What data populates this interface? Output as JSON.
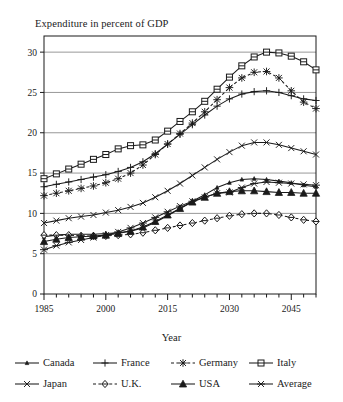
{
  "chart_data": {
    "type": "line",
    "title": "Expenditure in percent of GDP",
    "xlabel": "Year",
    "ylabel": "",
    "xlim": [
      1985,
      2051
    ],
    "ylim": [
      0,
      32
    ],
    "grid": "horizontal",
    "x_ticks": [
      1985,
      2000,
      2015,
      2030,
      2045
    ],
    "x_minor_step": 3,
    "y_ticks": [
      0,
      5,
      10,
      15,
      20,
      25,
      30
    ],
    "legend_position": "bottom",
    "marker_step_years": 3,
    "x": [
      1985,
      1988,
      1991,
      1994,
      1997,
      2000,
      2003,
      2006,
      2009,
      2012,
      2015,
      2018,
      2021,
      2024,
      2027,
      2030,
      2033,
      2036,
      2039,
      2042,
      2045,
      2048,
      2051
    ],
    "series": [
      {
        "name": "Canada",
        "marker": "small-triangle",
        "dash": "solid",
        "values": [
          7.1,
          7.3,
          7.4,
          7.4,
          7.4,
          7.5,
          7.6,
          7.8,
          8.2,
          8.9,
          9.7,
          10.6,
          11.5,
          12.3,
          13.2,
          13.8,
          14.2,
          14.3,
          14.2,
          14.0,
          13.8,
          13.5,
          13.3
        ]
      },
      {
        "name": "France",
        "marker": "plus",
        "dash": "solid",
        "values": [
          13.3,
          13.6,
          13.9,
          14.2,
          14.5,
          14.8,
          15.2,
          15.7,
          16.4,
          17.4,
          18.6,
          19.8,
          21.0,
          22.2,
          23.3,
          24.2,
          24.8,
          25.1,
          25.2,
          25.0,
          24.6,
          24.2,
          24.0
        ]
      },
      {
        "name": "Germany",
        "marker": "asterisk",
        "dash": "dashed",
        "values": [
          12.2,
          12.5,
          12.8,
          13.1,
          13.4,
          13.8,
          14.3,
          15.0,
          16.0,
          17.3,
          18.6,
          19.9,
          21.2,
          22.6,
          24.1,
          25.6,
          26.8,
          27.5,
          27.6,
          26.8,
          25.2,
          23.8,
          23.0
        ]
      },
      {
        "name": "Italy",
        "marker": "open-square",
        "dash": "solid",
        "values": [
          14.3,
          14.9,
          15.5,
          16.1,
          16.7,
          17.3,
          18.0,
          18.4,
          18.5,
          19.1,
          20.2,
          21.4,
          22.6,
          23.9,
          25.4,
          26.9,
          28.3,
          29.4,
          30.0,
          29.9,
          29.5,
          28.8,
          27.8
        ]
      },
      {
        "name": "Japan",
        "marker": "x-cross",
        "dash": "solid",
        "values": [
          8.8,
          9.1,
          9.4,
          9.6,
          9.8,
          10.1,
          10.4,
          10.8,
          11.3,
          12.0,
          12.8,
          13.7,
          14.7,
          15.7,
          16.7,
          17.6,
          18.4,
          18.8,
          18.8,
          18.5,
          18.1,
          17.7,
          17.3
        ]
      },
      {
        "name": "U.K.",
        "marker": "open-diamond",
        "dash": "dashed",
        "values": [
          7.3,
          7.3,
          7.3,
          7.2,
          7.2,
          7.2,
          7.3,
          7.4,
          7.6,
          7.9,
          8.2,
          8.5,
          8.8,
          9.1,
          9.4,
          9.7,
          9.9,
          10.0,
          10.0,
          9.8,
          9.5,
          9.2,
          9.0
        ]
      },
      {
        "name": "USA",
        "marker": "filled-triangle",
        "dash": "solid",
        "values": [
          6.5,
          6.8,
          7.0,
          7.1,
          7.2,
          7.3,
          7.5,
          7.8,
          8.3,
          9.0,
          9.8,
          10.6,
          11.4,
          12.0,
          12.5,
          12.7,
          12.8,
          12.8,
          12.7,
          12.6,
          12.6,
          12.5,
          12.5
        ]
      },
      {
        "name": "Average",
        "marker": "star-x",
        "dash": "solid",
        "values": [
          5.5,
          6.0,
          6.4,
          6.7,
          7.0,
          7.3,
          7.7,
          8.2,
          8.8,
          9.5,
          10.2,
          10.9,
          11.5,
          12.0,
          12.5,
          12.6,
          13.2,
          13.7,
          13.9,
          13.8,
          13.7,
          13.6,
          13.5
        ]
      }
    ]
  },
  "legend": {
    "items": [
      {
        "label": "Canada"
      },
      {
        "label": "France"
      },
      {
        "label": "Germany"
      },
      {
        "label": "Italy"
      },
      {
        "label": "Japan"
      },
      {
        "label": "U.K."
      },
      {
        "label": "USA"
      },
      {
        "label": "Average"
      }
    ]
  },
  "colors": {
    "ink": "#1a1a1a",
    "grid": "#8c8c8c",
    "frame": "#1a1a1a",
    "background": "#ffffff"
  }
}
